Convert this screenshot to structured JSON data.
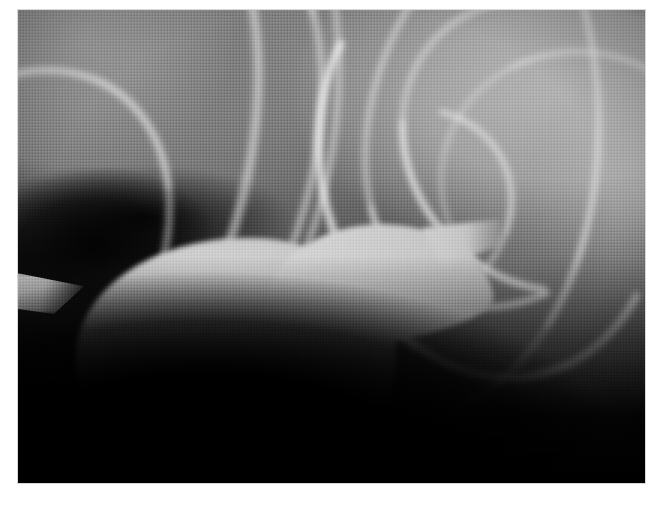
{
  "page": {
    "background_color": "#ffffff",
    "width": 661,
    "height": 507
  },
  "figure": {
    "name": "oral-cholecystogram",
    "modality": "radiograph",
    "frame": {
      "left": 18,
      "top": 10,
      "width": 627,
      "height": 473,
      "border_color": "#d8d8d8"
    },
    "palette": {
      "contrast_filled_gallbladder": "#cfcfcf",
      "bright_rib_cortex": "#eeeeee",
      "liver_soft_tissue": "#6a6a6a",
      "right_soft_tissue": "#a3a3a3",
      "deep_shadow": "#000000",
      "film_background": "#050505"
    },
    "regions": [
      {
        "name": "gallbladder",
        "description": "Pear-shaped contrast-opacified gallbladder, fundus inferolateral left, neck tapering superomedially to the right",
        "brightness": "bright",
        "approx_bounds": {
          "x": 76,
          "y": 222,
          "width": 410,
          "height": 250
        }
      },
      {
        "name": "gallbladder-fundus",
        "description": "Rounded inferior pole of the gallbladder",
        "brightness": "bright",
        "approx_bounds": {
          "x": 80,
          "y": 300,
          "width": 250,
          "height": 165
        }
      },
      {
        "name": "gallbladder-neck",
        "description": "Narrowed superior neck continuing toward the cystic duct",
        "brightness": "bright",
        "approx_bounds": {
          "x": 380,
          "y": 218,
          "width": 106,
          "height": 60
        }
      },
      {
        "name": "rib-shadows-left",
        "description": "Obliquely descending left rib cortical margins",
        "brightness": "bright-lines",
        "approx_bounds": {
          "x": 18,
          "y": 10,
          "width": 300,
          "height": 230
        }
      },
      {
        "name": "rib-shadows-right",
        "description": "Crossing rib shadows forming an X over the right upper quadrant",
        "brightness": "bright-lines",
        "approx_bounds": {
          "x": 380,
          "y": 10,
          "width": 265,
          "height": 240
        }
      },
      {
        "name": "rib-tip-left-margin",
        "description": "Triangular rib tip projecting from the left image margin",
        "brightness": "mid",
        "approx_bounds": {
          "x": 12,
          "y": 262,
          "width": 72,
          "height": 42
        }
      },
      {
        "name": "liver-parenchyma",
        "description": "Homogeneous mid-gray liver shadow occupying the upper field",
        "brightness": "mid-gray",
        "approx_bounds": {
          "x": 150,
          "y": 30,
          "width": 330,
          "height": 190
        }
      },
      {
        "name": "infrahepatic-shadow",
        "description": "Deep black region inferior and left of the gallbladder",
        "brightness": "black",
        "approx_bounds": {
          "x": 18,
          "y": 380,
          "width": 627,
          "height": 103
        }
      }
    ]
  },
  "caption": {
    "text": ""
  }
}
